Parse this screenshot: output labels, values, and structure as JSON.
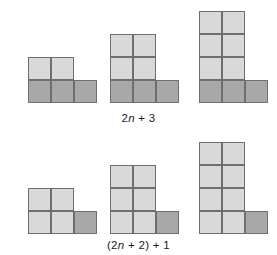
{
  "page": {
    "background_color": "#ffffff",
    "width": 277,
    "height": 255
  },
  "colors": {
    "light_block": "#d9d9d9",
    "dark_block": "#a8a8a8",
    "block_outline": "#6e6e6e",
    "caption_text": "#1a1a1a"
  },
  "captions": {
    "top": {
      "full_text": "2n + 3",
      "prefix": "2",
      "variable": "n",
      "suffix": " + 3"
    },
    "bottom": {
      "full_text": "(2n + 2) + 1",
      "prefix": "(2",
      "variable": "n",
      "suffix": " + 2) + 1"
    }
  },
  "rows": [
    {
      "name": "top-row",
      "caption_key": "top",
      "figures": [
        {
          "name": "figure-top-1",
          "light_rows": 1,
          "light_columns": 2,
          "dark_row_cells": 3,
          "dark_position": "full-base-row",
          "total_blocks": 5
        },
        {
          "name": "figure-top-2",
          "light_rows": 2,
          "light_columns": 2,
          "dark_row_cells": 3,
          "dark_position": "full-base-row",
          "total_blocks": 7
        },
        {
          "name": "figure-top-3",
          "light_rows": 3,
          "light_columns": 2,
          "dark_row_cells": 3,
          "dark_position": "full-base-row",
          "total_blocks": 9
        }
      ]
    },
    {
      "name": "bottom-row",
      "caption_key": "bottom",
      "figures": [
        {
          "name": "figure-bottom-1",
          "light_rows": 2,
          "light_columns": 2,
          "dark_row_cells": 1,
          "dark_position": "bottom-right-single",
          "total_blocks": 5
        },
        {
          "name": "figure-bottom-2",
          "light_rows": 3,
          "light_columns": 2,
          "dark_row_cells": 1,
          "dark_position": "bottom-right-single",
          "total_blocks": 7
        },
        {
          "name": "figure-bottom-3",
          "light_rows": 4,
          "light_columns": 2,
          "dark_row_cells": 1,
          "dark_position": "bottom-right-single",
          "total_blocks": 9
        }
      ]
    }
  ],
  "geometry": {
    "cell_size": 23,
    "top_row_baseline_y": 103,
    "bottom_row_baseline_y": 234,
    "figure_left_x": [
      28,
      110,
      199
    ],
    "top_caption_y": 112,
    "bottom_caption_y": 239
  }
}
